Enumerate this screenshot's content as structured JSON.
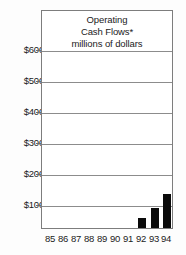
{
  "chart_data": {
    "type": "bar",
    "title": "Operating Cash Flows* millions of dollars",
    "title_lines": [
      "Operating",
      "Cash Flows*",
      "millions of dollars"
    ],
    "xlabel": "",
    "ylabel": "",
    "categories": [
      "85",
      "86",
      "87",
      "88",
      "89",
      "90",
      "91",
      "92",
      "93",
      "94"
    ],
    "values": [
      246,
      270,
      311,
      356,
      380,
      425,
      450,
      480,
      514,
      558
    ],
    "ylim": [
      0,
      620
    ],
    "yticks": [
      100,
      200,
      300,
      400,
      500,
      600
    ],
    "ytick_labels": [
      "$100",
      "$200",
      "$300",
      "$400",
      "$500",
      "$600"
    ],
    "grid": true,
    "grid_axis": "y",
    "legend": "none",
    "bar_color": "#0a0a0a",
    "frame_color": "#7d7d7d",
    "gridline_color": "#8c8c8c",
    "background_color": "#ffffff"
  }
}
